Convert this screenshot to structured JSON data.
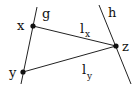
{
  "diagram": {
    "colors": {
      "stroke": "#222222",
      "text": "#111111",
      "background": "#ffffff"
    },
    "lines": {
      "g": {
        "label": "g",
        "x1": 37,
        "y1": 7,
        "x2": 21,
        "y2": 84
      },
      "h": {
        "label": "h",
        "x1": 99,
        "y1": 5,
        "x2": 131,
        "y2": 84
      }
    },
    "points": {
      "x": {
        "label": "x",
        "cx": 33,
        "cy": 26
      },
      "y": {
        "label": "y",
        "cx": 23,
        "cy": 72
      },
      "z": {
        "label": "z",
        "cx": 116,
        "cy": 46
      }
    },
    "segments": {
      "lx": {
        "label": "l",
        "subscript": "x"
      },
      "ly": {
        "label": "l",
        "subscript": "y"
      }
    }
  }
}
